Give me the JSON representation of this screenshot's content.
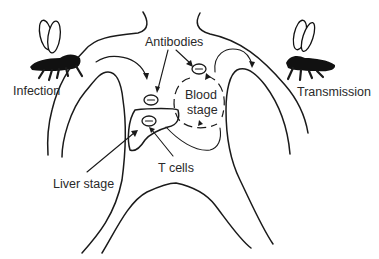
{
  "diagram": {
    "type": "malaria-immune-response-body-diagram",
    "labels": {
      "infection": "Infection",
      "transmission": "Transmission",
      "antibodies": "Antibodies",
      "blood_stage_line1": "Blood",
      "blood_stage_line2": "stage",
      "t_cells": "T cells",
      "liver_stage": "Liver stage"
    },
    "antibody_symbols": [
      {
        "id": "antibody-blood",
        "glyph": "−"
      },
      {
        "id": "antibody-liver-upper",
        "glyph": "−"
      },
      {
        "id": "antibody-liver-inner",
        "glyph": "−"
      }
    ],
    "icons": [
      "mosquito-left-icon",
      "mosquito-right-icon"
    ],
    "colors": {
      "stroke": "#1a1a1a",
      "text": "#2a2a2a",
      "background": "#ffffff"
    }
  }
}
